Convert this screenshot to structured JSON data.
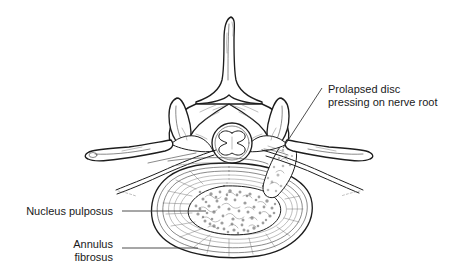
{
  "figure": {
    "background_color": "#ffffff",
    "ink_color": "#1d1d1d",
    "label_color": "#1a1a1a",
    "leader_color": "#3a3a3a",
    "stipple_color": "#8e8e8e"
  },
  "labels": {
    "prolapse": {
      "line1": "Prolapsed disc",
      "line2": "pressing on nerve root",
      "align": "left",
      "x": 328,
      "y1": 93,
      "y2": 106
    },
    "nucleus": {
      "line1": "Nucleus pulposus",
      "align": "right",
      "x": 113,
      "y1": 214
    },
    "annulus": {
      "line1": "Annulus",
      "line2": "fibrosus",
      "align": "right",
      "x": 113,
      "y1": 247,
      "y2": 260
    }
  },
  "structures": [
    {
      "name": "spinous-process",
      "description": "Posterior midline bony spike"
    },
    {
      "name": "lamina",
      "description": "Bony plate between spinous process and facet"
    },
    {
      "name": "superior-articular-facet-left",
      "description": "Left upright facet horn"
    },
    {
      "name": "superior-articular-facet-right",
      "description": "Right upright facet horn"
    },
    {
      "name": "transverse-process-left",
      "description": "Left lateral wing of bone"
    },
    {
      "name": "transverse-process-right",
      "description": "Right lateral wing of bone"
    },
    {
      "name": "spinal-cord",
      "description": "Circular cord with butterfly grey matter in vertebral canal"
    },
    {
      "name": "nerve-root-left",
      "description": "Nerve root passing laterally left"
    },
    {
      "name": "nerve-root-right",
      "description": "Nerve root compressed by prolapse"
    },
    {
      "name": "annulus-fibrosus",
      "description": "Concentric fibrous rings of disc"
    },
    {
      "name": "nucleus-pulposus",
      "description": "Stippled gel centre of disc"
    },
    {
      "name": "disc-prolapse",
      "description": "Posterolateral herniation of nucleus material"
    }
  ]
}
